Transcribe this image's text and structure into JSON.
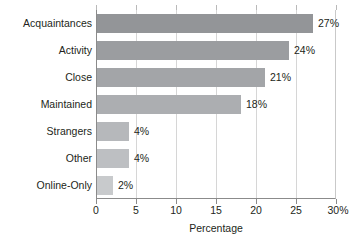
{
  "chart_data": {
    "type": "bar",
    "orientation": "horizontal",
    "title": "",
    "xlabel": "Percentage",
    "ylabel": "",
    "categories": [
      "Acquaintances",
      "Activity",
      "Close",
      "Maintained",
      "Strangers",
      "Other",
      "Online-Only"
    ],
    "values": [
      27,
      24,
      21,
      18,
      4,
      4,
      2
    ],
    "value_labels": [
      "27%",
      "24%",
      "21%",
      "18%",
      "4%",
      "4%",
      "2%"
    ],
    "xlim": [
      0,
      30
    ],
    "xticks": [
      0,
      5,
      10,
      15,
      20,
      25,
      30
    ],
    "xtick_labels": [
      "0",
      "5",
      "10",
      "15",
      "20",
      "25",
      "30%"
    ],
    "grid": true,
    "legend": false,
    "bar_colors": [
      "#939598",
      "#9b9da0",
      "#a3a5a8",
      "#acaeb1",
      "#b6b8bb",
      "#bdbfc2",
      "#c8cacc"
    ],
    "grid_color": "#d6d6d6",
    "axis_color": "#8b8b8b",
    "text_color": "#231f20",
    "background": "#ffffff"
  }
}
